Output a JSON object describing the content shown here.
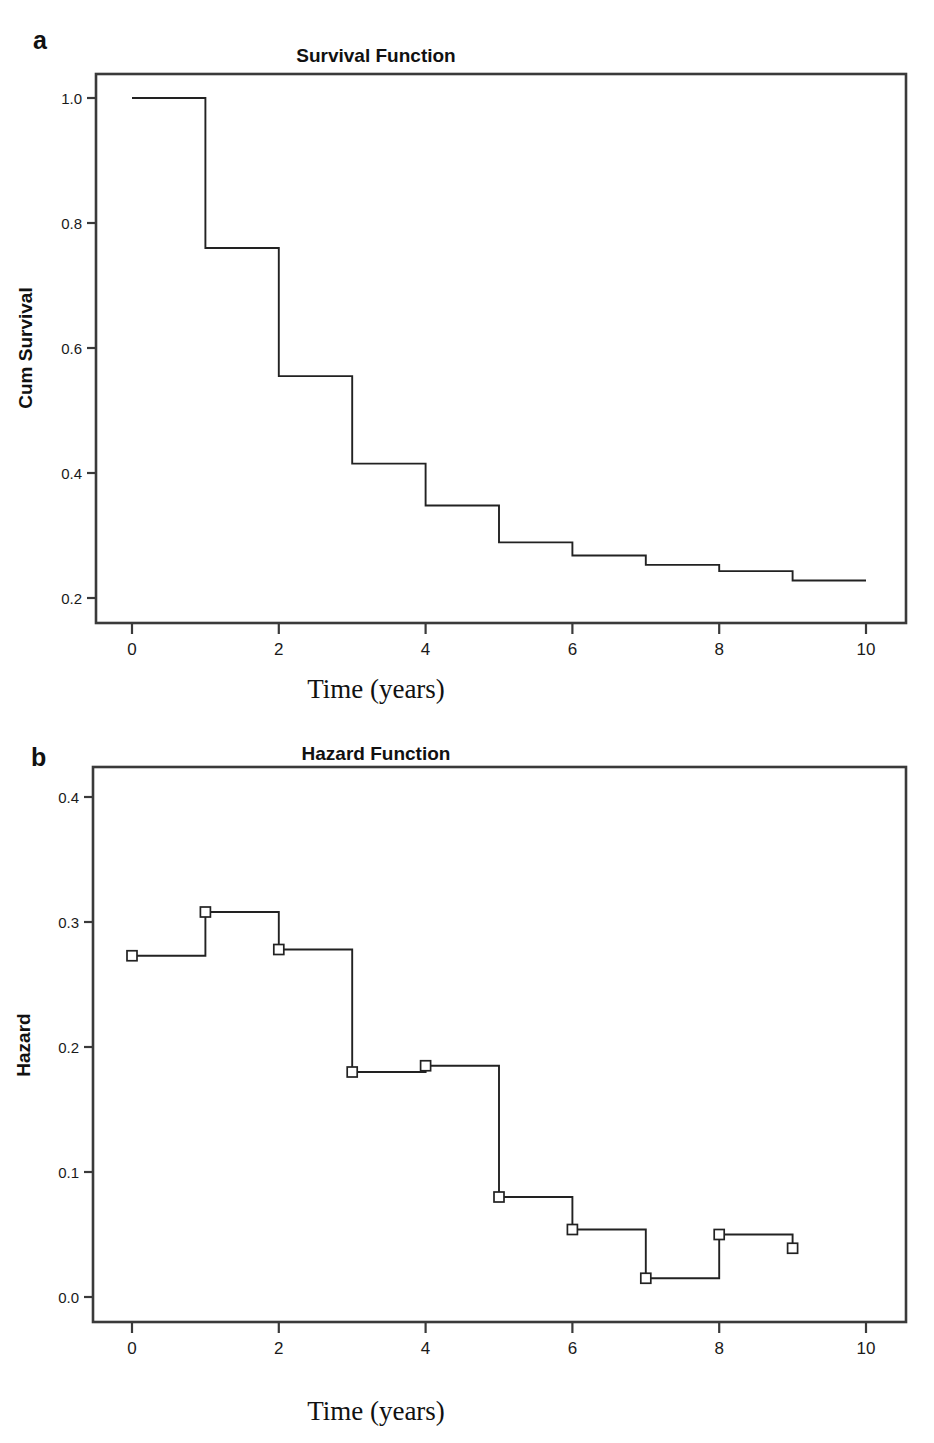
{
  "figure": {
    "panel_a_letter": "a",
    "panel_b_letter": "b"
  },
  "chart_data": [
    {
      "id": "survival",
      "type": "line",
      "subtype": "kaplan-meier-step",
      "title": "Survival Function",
      "xlabel": "Time (years)",
      "ylabel": "Cum Survival",
      "xlim": [
        -0.45,
        10.6
      ],
      "ylim": [
        0.16,
        1.06
      ],
      "xticks": [
        0,
        2,
        4,
        6,
        8,
        10
      ],
      "xtick_labels": [
        "0",
        "2",
        "4",
        "6",
        "8",
        "10"
      ],
      "yticks": [
        0.2,
        0.4,
        0.6,
        0.8,
        1.0
      ],
      "ytick_labels": [
        "0.2",
        "0.4",
        "0.6",
        "0.8",
        "1.0"
      ],
      "grid": false,
      "legend": false,
      "markers": false,
      "x": [
        0,
        1,
        2,
        3,
        4,
        5,
        6,
        7,
        8,
        9,
        10
      ],
      "values": [
        1.0,
        0.76,
        0.555,
        0.415,
        0.348,
        0.289,
        0.268,
        0.253,
        0.243,
        0.228,
        0.228
      ],
      "steps": [
        {
          "t_start": 0,
          "t_end": 1,
          "survival": 1.0
        },
        {
          "t_start": 1,
          "t_end": 2,
          "survival": 0.76
        },
        {
          "t_start": 2,
          "t_end": 3,
          "survival": 0.555
        },
        {
          "t_start": 3,
          "t_end": 4,
          "survival": 0.415
        },
        {
          "t_start": 4,
          "t_end": 5,
          "survival": 0.348
        },
        {
          "t_start": 5,
          "t_end": 6,
          "survival": 0.289
        },
        {
          "t_start": 6,
          "t_end": 7,
          "survival": 0.268
        },
        {
          "t_start": 7,
          "t_end": 8,
          "survival": 0.253
        },
        {
          "t_start": 8,
          "t_end": 9,
          "survival": 0.243
        },
        {
          "t_start": 9,
          "t_end": 10,
          "survival": 0.228
        }
      ]
    },
    {
      "id": "hazard",
      "type": "line",
      "subtype": "step-with-markers",
      "title": "Hazard Function",
      "xlabel": "Time (years)",
      "ylabel": "Hazard",
      "xlim": [
        -0.45,
        10.6
      ],
      "ylim": [
        -0.015,
        0.425
      ],
      "xticks": [
        0,
        2,
        4,
        6,
        8,
        10
      ],
      "xtick_labels": [
        "0",
        "2",
        "4",
        "6",
        "8",
        "10"
      ],
      "yticks": [
        0.0,
        0.1,
        0.2,
        0.3,
        0.4
      ],
      "ytick_labels": [
        "0.0",
        "0.1",
        "0.2",
        "0.3",
        "0.4"
      ],
      "grid": false,
      "legend": false,
      "markers": true,
      "marker_shape": "open-square",
      "x": [
        0,
        1,
        2,
        3,
        4,
        5,
        6,
        7,
        8,
        9
      ],
      "values": [
        0.273,
        0.308,
        0.278,
        0.18,
        0.185,
        0.08,
        0.054,
        0.015,
        0.05,
        0.039
      ]
    }
  ]
}
